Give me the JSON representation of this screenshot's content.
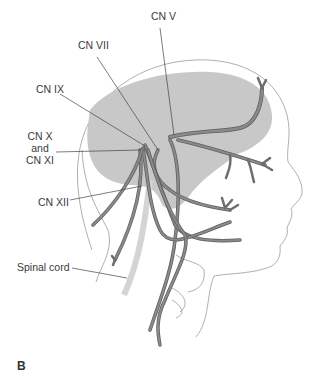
{
  "figure": {
    "panel_letter": "B",
    "labels": [
      {
        "id": "cn-v",
        "text": "CN V"
      },
      {
        "id": "cn-vii",
        "text": "CN VII"
      },
      {
        "id": "cn-ix",
        "text": "CN IX"
      },
      {
        "id": "cn-x-xi",
        "text_line1": "CN X",
        "text_line2": "and",
        "text_line3": "CN XI"
      },
      {
        "id": "cn-xii",
        "text": "CN XII"
      },
      {
        "id": "spinal-cord",
        "text": "Spinal cord"
      }
    ],
    "colors": {
      "brain": "#c8c8c8",
      "nerve_fill": "#8a8a8a",
      "nerve_outline": "#5e5e5e",
      "outline": "#9a9a9a",
      "leader": "#444444",
      "spinal_cord": "#d4d4d4"
    }
  }
}
